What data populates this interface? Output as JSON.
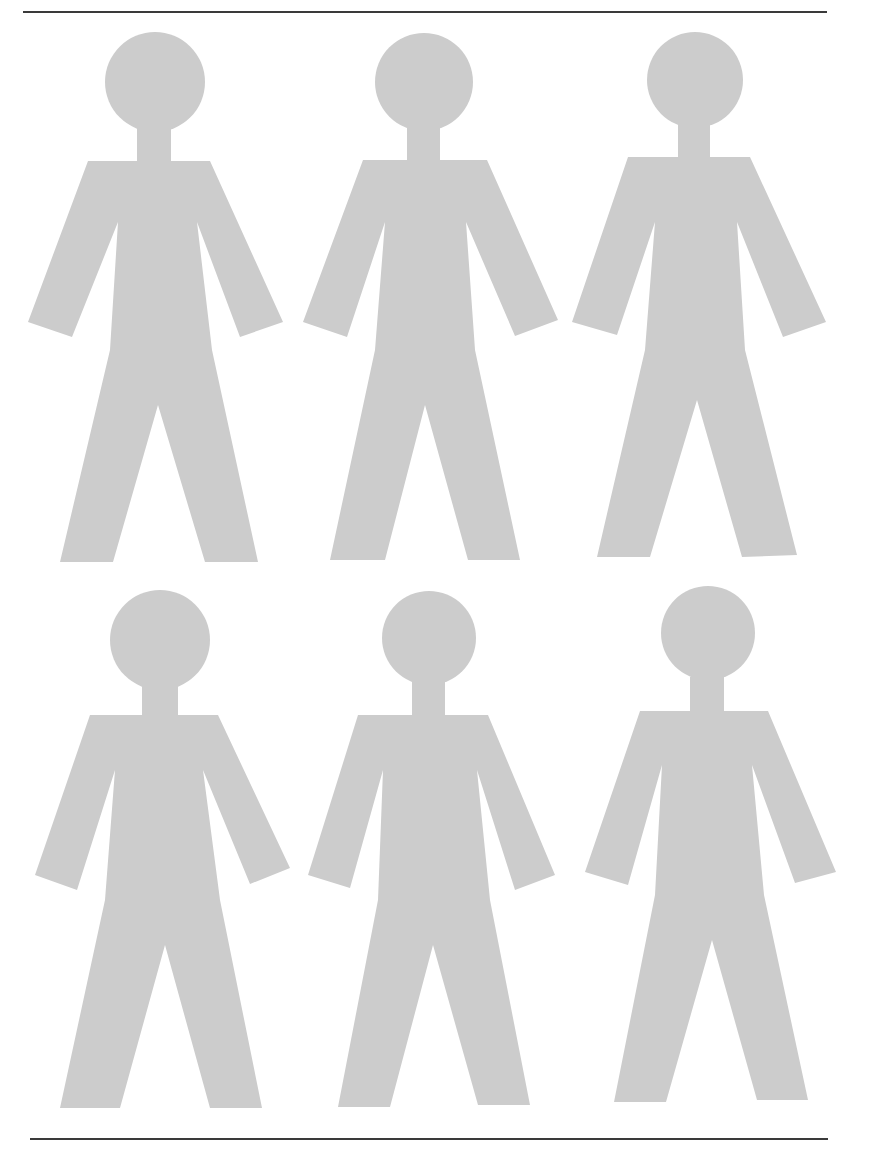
{
  "page": {
    "width": 872,
    "height": 1157,
    "background": "#ffffff"
  },
  "rules": {
    "color": "#3a3a3a",
    "top": {
      "x1": 23,
      "x2": 827,
      "y": 11
    },
    "bottom": {
      "x1": 30,
      "x2": 828,
      "y": 1138
    }
  },
  "figures": {
    "color": "#cccccc",
    "count": 6,
    "items": [
      {
        "id": "figure-1",
        "row": 1,
        "col": 1,
        "head": {
          "cx": 155,
          "cy": 82,
          "r": 50
        },
        "body": [
          [
            137,
            128
          ],
          [
            171,
            128
          ],
          [
            171,
            161
          ],
          [
            210,
            161
          ],
          [
            283,
            322
          ],
          [
            240,
            337
          ],
          [
            197,
            222
          ],
          [
            212,
            350
          ],
          [
            258,
            562
          ],
          [
            205,
            562
          ],
          [
            158,
            405
          ],
          [
            113,
            562
          ],
          [
            60,
            562
          ],
          [
            110,
            350
          ],
          [
            118,
            222
          ],
          [
            72,
            337
          ],
          [
            28,
            322
          ],
          [
            88,
            161
          ],
          [
            137,
            161
          ]
        ]
      },
      {
        "id": "figure-2",
        "row": 1,
        "col": 2,
        "head": {
          "cx": 424,
          "cy": 82,
          "r": 49
        },
        "body": [
          [
            407,
            128
          ],
          [
            440,
            128
          ],
          [
            440,
            160
          ],
          [
            487,
            160
          ],
          [
            558,
            320
          ],
          [
            515,
            336
          ],
          [
            466,
            222
          ],
          [
            475,
            350
          ],
          [
            520,
            560
          ],
          [
            468,
            560
          ],
          [
            425,
            405
          ],
          [
            385,
            560
          ],
          [
            330,
            560
          ],
          [
            375,
            350
          ],
          [
            385,
            222
          ],
          [
            347,
            337
          ],
          [
            303,
            322
          ],
          [
            363,
            160
          ],
          [
            407,
            160
          ]
        ]
      },
      {
        "id": "figure-3",
        "row": 1,
        "col": 3,
        "head": {
          "cx": 695,
          "cy": 80,
          "r": 48
        },
        "body": [
          [
            678,
            125
          ],
          [
            710,
            125
          ],
          [
            710,
            157
          ],
          [
            750,
            157
          ],
          [
            826,
            322
          ],
          [
            783,
            337
          ],
          [
            737,
            222
          ],
          [
            745,
            350
          ],
          [
            797,
            555
          ],
          [
            742,
            557
          ],
          [
            697,
            400
          ],
          [
            650,
            557
          ],
          [
            597,
            557
          ],
          [
            645,
            350
          ],
          [
            655,
            222
          ],
          [
            617,
            335
          ],
          [
            572,
            322
          ],
          [
            628,
            157
          ],
          [
            678,
            157
          ]
        ]
      },
      {
        "id": "figure-4",
        "row": 2,
        "col": 1,
        "head": {
          "cx": 160,
          "cy": 640,
          "r": 50
        },
        "body": [
          [
            142,
            686
          ],
          [
            178,
            686
          ],
          [
            178,
            715
          ],
          [
            218,
            715
          ],
          [
            290,
            868
          ],
          [
            250,
            884
          ],
          [
            203,
            770
          ],
          [
            220,
            900
          ],
          [
            262,
            1108
          ],
          [
            210,
            1108
          ],
          [
            165,
            945
          ],
          [
            120,
            1108
          ],
          [
            60,
            1108
          ],
          [
            105,
            900
          ],
          [
            115,
            770
          ],
          [
            77,
            890
          ],
          [
            35,
            875
          ],
          [
            90,
            715
          ],
          [
            142,
            715
          ]
        ]
      },
      {
        "id": "figure-5",
        "row": 2,
        "col": 2,
        "head": {
          "cx": 429,
          "cy": 638,
          "r": 47
        },
        "body": [
          [
            412,
            682
          ],
          [
            445,
            682
          ],
          [
            445,
            715
          ],
          [
            488,
            715
          ],
          [
            555,
            875
          ],
          [
            515,
            890
          ],
          [
            477,
            770
          ],
          [
            490,
            900
          ],
          [
            530,
            1105
          ],
          [
            478,
            1105
          ],
          [
            433,
            945
          ],
          [
            390,
            1107
          ],
          [
            338,
            1107
          ],
          [
            378,
            900
          ],
          [
            383,
            770
          ],
          [
            350,
            888
          ],
          [
            308,
            875
          ],
          [
            358,
            715
          ],
          [
            412,
            715
          ]
        ]
      },
      {
        "id": "figure-6",
        "row": 2,
        "col": 3,
        "head": {
          "cx": 708,
          "cy": 633,
          "r": 47
        },
        "body": [
          [
            690,
            677
          ],
          [
            724,
            677
          ],
          [
            724,
            711
          ],
          [
            768,
            711
          ],
          [
            836,
            872
          ],
          [
            795,
            883
          ],
          [
            752,
            765
          ],
          [
            764,
            895
          ],
          [
            808,
            1100
          ],
          [
            757,
            1100
          ],
          [
            712,
            940
          ],
          [
            666,
            1102
          ],
          [
            614,
            1102
          ],
          [
            655,
            895
          ],
          [
            662,
            765
          ],
          [
            628,
            885
          ],
          [
            585,
            872
          ],
          [
            640,
            711
          ],
          [
            690,
            711
          ]
        ]
      }
    ]
  }
}
